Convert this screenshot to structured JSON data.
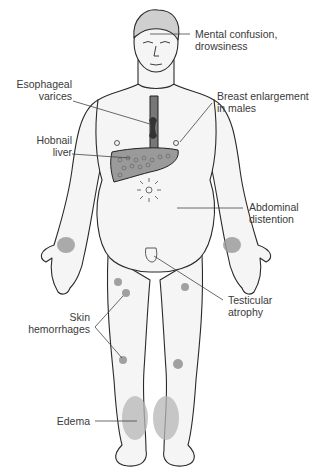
{
  "diagram": {
    "labels": {
      "mental": "Mental confusion,\ndrowsiness",
      "esophageal": "Esophageal\nvarices",
      "breast": "Breast enlargement\nin males",
      "liver": "Hobnail\nliver",
      "abdominal": "Abdominal\ndistention",
      "testicular": "Testicular\natrophy",
      "skin": "Skin\nhemorrhages",
      "edema": "Edema"
    },
    "colors": {
      "line": "#2a2a2a",
      "shade": "#a9a9a9",
      "skin": "#f4f4f4",
      "text": "#3a3a3a"
    }
  }
}
